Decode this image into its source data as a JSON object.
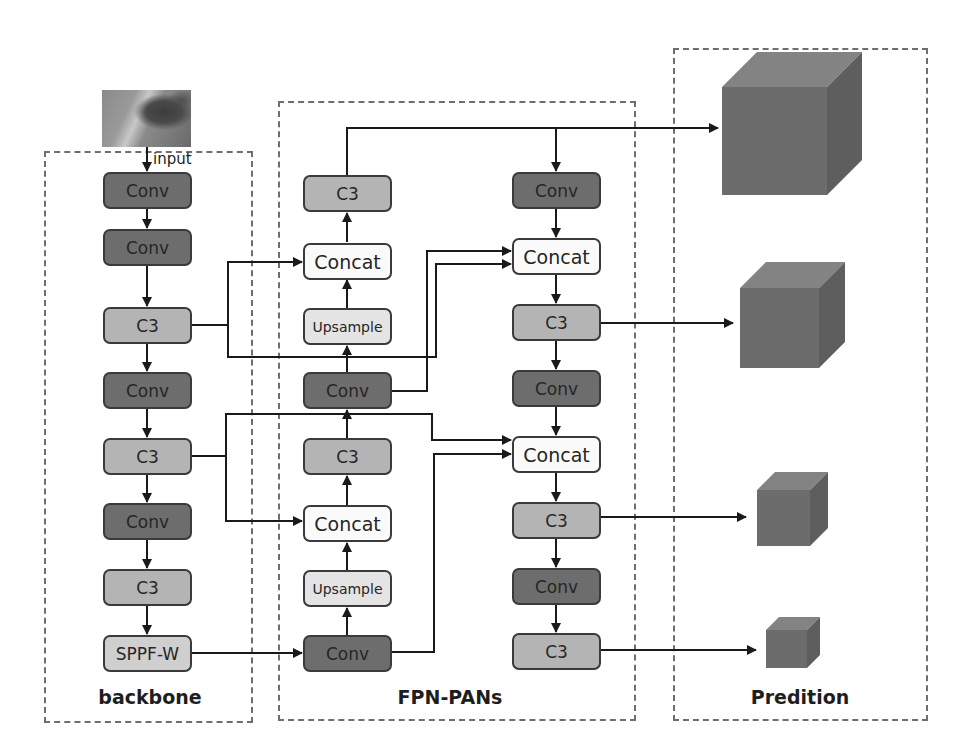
{
  "input": {
    "label": "input",
    "image": "input-feature-image"
  },
  "groups": {
    "backbone": {
      "label": "backbone"
    },
    "neck": {
      "label": "FPN-PANs"
    },
    "head": {
      "label": "Predition"
    }
  },
  "backbone": {
    "nodes": [
      {
        "id": "b1",
        "label": "Conv",
        "type": "conv"
      },
      {
        "id": "b2",
        "label": "Conv",
        "type": "conv"
      },
      {
        "id": "b3",
        "label": "C3",
        "type": "c3"
      },
      {
        "id": "b4",
        "label": "Conv",
        "type": "conv"
      },
      {
        "id": "b5",
        "label": "C3",
        "type": "c3"
      },
      {
        "id": "b6",
        "label": "Conv",
        "type": "conv"
      },
      {
        "id": "b7",
        "label": "C3",
        "type": "c3"
      },
      {
        "id": "b8",
        "label": "SPPF-W",
        "type": "sppf"
      }
    ]
  },
  "fpn": {
    "nodes": [
      {
        "id": "f1",
        "label": "C3",
        "type": "c3"
      },
      {
        "id": "f2",
        "label": "Concat",
        "type": "concat"
      },
      {
        "id": "f3",
        "label": "Upsample",
        "type": "upsample"
      },
      {
        "id": "f4",
        "label": "Conv",
        "type": "conv"
      },
      {
        "id": "f5",
        "label": "C3",
        "type": "c3"
      },
      {
        "id": "f6",
        "label": "Concat",
        "type": "concat"
      },
      {
        "id": "f7",
        "label": "Upsample",
        "type": "upsample"
      },
      {
        "id": "f8",
        "label": "Conv",
        "type": "conv"
      }
    ]
  },
  "pan": {
    "nodes": [
      {
        "id": "p1",
        "label": "Conv",
        "type": "conv"
      },
      {
        "id": "p2",
        "label": "Concat",
        "type": "concat"
      },
      {
        "id": "p3",
        "label": "C3",
        "type": "c3"
      },
      {
        "id": "p4",
        "label": "Conv",
        "type": "conv"
      },
      {
        "id": "p5",
        "label": "Concat",
        "type": "concat"
      },
      {
        "id": "p6",
        "label": "C3",
        "type": "c3"
      },
      {
        "id": "p7",
        "label": "Conv",
        "type": "conv"
      },
      {
        "id": "p8",
        "label": "C3",
        "type": "c3"
      }
    ]
  },
  "prediction": {
    "outputs": [
      {
        "id": "o1",
        "shape": "cube",
        "size": "large"
      },
      {
        "id": "o2",
        "shape": "cube",
        "size": "medium"
      },
      {
        "id": "o3",
        "shape": "cube",
        "size": "small"
      },
      {
        "id": "o4",
        "shape": "cube",
        "size": "tiny"
      }
    ]
  },
  "colors": {
    "conv": "#6d6d6d",
    "c3": "#b4b4b4",
    "concat": "#fafafa",
    "upsample": "#e4e4e4",
    "sppf": "#cfcfcf",
    "cube_front": "#6a6a6a",
    "cube_top": "#808080",
    "cube_side": "#5c5c5c",
    "dash": "#6e6e6e",
    "wire": "#1a1a1a"
  }
}
